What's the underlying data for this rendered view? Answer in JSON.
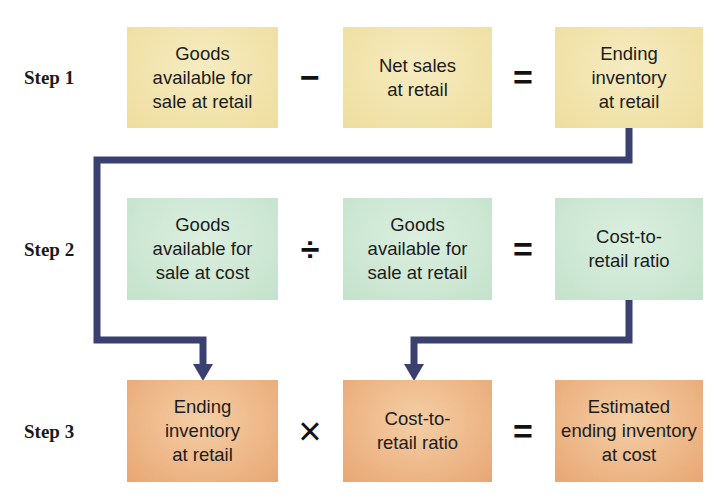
{
  "colors": {
    "step1_box": "#eedd9c",
    "step2_box": "#c3e2cb",
    "step3_box": "#e9a673",
    "connector": "#3a4170"
  },
  "steps": [
    {
      "label": "Step 1",
      "terms": [
        "Goods\navailable for\nsale at retail",
        "Net sales\nat retail",
        "Ending\ninventory\nat retail"
      ],
      "operator": "−",
      "equals": "="
    },
    {
      "label": "Step 2",
      "terms": [
        "Goods\navailable for\nsale at cost",
        "Goods\navailable for\nsale at retail",
        "Cost-to-\nretail ratio"
      ],
      "operator": "÷",
      "equals": "="
    },
    {
      "label": "Step 3",
      "terms": [
        "Ending\ninventory\nat retail",
        "Cost-to-\nretail ratio",
        "Estimated\nending inventory\nat cost"
      ],
      "operator": "×",
      "equals": "="
    }
  ],
  "connectors": [
    {
      "from": "Step 1: Ending inventory at retail",
      "to": "Step 3: Ending inventory at retail"
    },
    {
      "from": "Step 2: Cost-to-retail ratio",
      "to": "Step 3: Cost-to-retail ratio"
    }
  ]
}
